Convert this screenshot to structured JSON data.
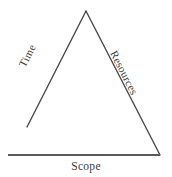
{
  "diagram": {
    "type": "triangle-diagram",
    "background_color": "#ffffff",
    "line_color": "#4a4a4a",
    "baseline_color": "#5a5a5a",
    "text_color": "#3a3a3a",
    "labels": {
      "left_edge": "Time",
      "right_edge": "Resources",
      "bottom_edge": "Scope"
    },
    "geometry": {
      "apex": [
        86,
        11
      ],
      "left_leg_end": [
        27,
        127
      ],
      "bottom_right_vertex": [
        160,
        155
      ],
      "baseline_start": [
        8,
        155
      ],
      "baseline_end": [
        160,
        155
      ],
      "left_leg_stroke_width": 1.4,
      "right_leg_stroke_width": 1.4,
      "baseline_stroke_width": 2.2
    }
  }
}
